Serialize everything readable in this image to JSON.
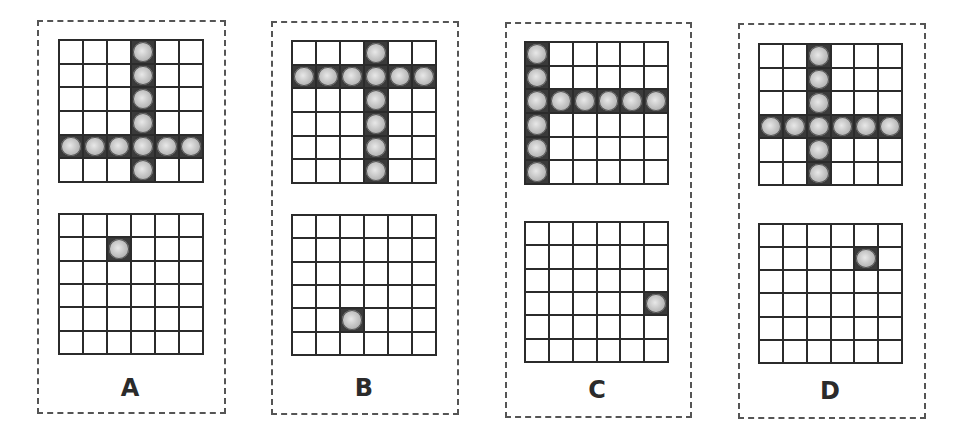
{
  "grid_size": 6,
  "panels": [
    {
      "label": "A",
      "top_grid_filled": {
        "column": 3,
        "row": 4
      },
      "bottom_grid_ball": {
        "row": 1,
        "col": 2
      }
    },
    {
      "label": "B",
      "top_grid_filled": {
        "column": 3,
        "row": 1
      },
      "bottom_grid_ball": {
        "row": 4,
        "col": 2
      }
    },
    {
      "label": "C",
      "top_grid_filled": {
        "column": 0,
        "row": 2
      },
      "bottom_grid_ball": {
        "row": 3,
        "col": 5
      }
    },
    {
      "label": "D",
      "top_grid_filled": {
        "column": 2,
        "row": 3
      },
      "bottom_grid_ball": {
        "row": 1,
        "col": 4
      }
    }
  ],
  "colors": {
    "line": "#2b2b2b",
    "ball": "#c4c4c4",
    "dash": "#555555"
  }
}
